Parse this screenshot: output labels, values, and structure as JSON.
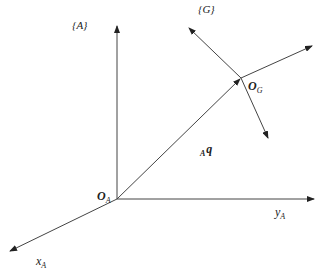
{
  "diagram": {
    "colors": {
      "line": "#333333",
      "text": "#222222",
      "background": "#ffffff"
    },
    "frames": {
      "A": {
        "label": "{A}",
        "origin_label": "O",
        "origin_sub": "A",
        "axes": {
          "x": {
            "label": "x",
            "sub": "A"
          },
          "y": {
            "label": "y",
            "sub": "A"
          },
          "z": {
            "label": "",
            "sub": ""
          }
        }
      },
      "G": {
        "label": "{G}",
        "origin_label": "O",
        "origin_sub": "G"
      }
    },
    "vector": {
      "pre_sub": "A",
      "label": "q"
    },
    "caption": ""
  }
}
